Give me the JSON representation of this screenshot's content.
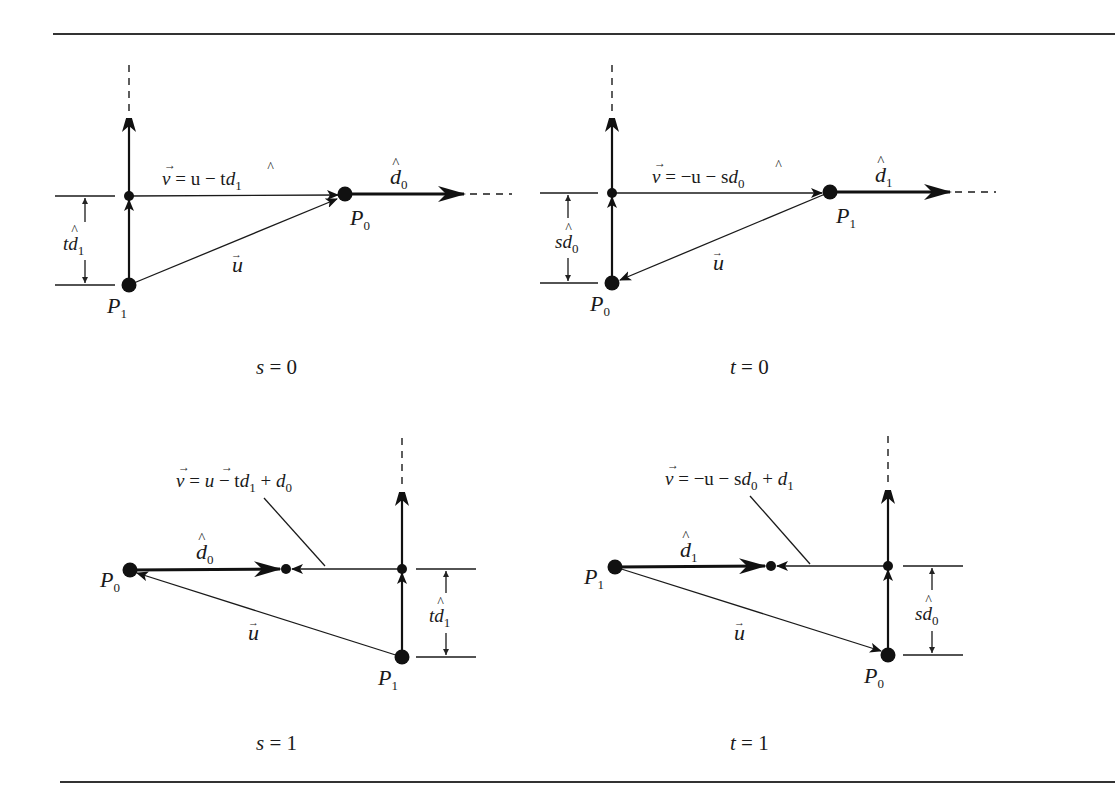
{
  "figure": {
    "rule_color": "#333333",
    "ink_color": "#111111",
    "panels": [
      {
        "id": "s0",
        "caption": {
          "var": "s",
          "eq": " = 0"
        },
        "equation": {
          "parts": [
            "v",
            " = u − t",
            "d",
            "1"
          ],
          "text": "v⃗ = u − td̂₁"
        },
        "dir_label": {
          "base": "d",
          "sub": "0"
        },
        "dim_label": {
          "pre": "t",
          "base": "d",
          "sub": "1"
        },
        "point_a": {
          "base": "P",
          "sub": "1"
        },
        "point_b": {
          "base": "P",
          "sub": "0"
        },
        "u_label": "u"
      },
      {
        "id": "t0",
        "caption": {
          "var": "t",
          "eq": " = 0"
        },
        "equation": {
          "text": "v⃗ = −u − sd̂₀"
        },
        "dir_label": {
          "base": "d",
          "sub": "1"
        },
        "dim_label": {
          "pre": "s",
          "base": "d",
          "sub": "0"
        },
        "point_a": {
          "base": "P",
          "sub": "0"
        },
        "point_b": {
          "base": "P",
          "sub": "1"
        },
        "u_label": "u"
      },
      {
        "id": "s1",
        "caption": {
          "var": "s",
          "eq": " = 1"
        },
        "equation": {
          "text": "v⃗ = u⃗ − td̂₁ + d̂₀"
        },
        "dir_label": {
          "base": "d",
          "sub": "0"
        },
        "dim_label": {
          "pre": "t",
          "base": "d",
          "sub": "1"
        },
        "point_a": {
          "base": "P",
          "sub": "1"
        },
        "point_b": {
          "base": "P",
          "sub": "0"
        },
        "u_label": "u"
      },
      {
        "id": "t1",
        "caption": {
          "var": "t",
          "eq": " = 1"
        },
        "equation": {
          "text": "v⃗ = −u − sd̂₀ + d̂₁"
        },
        "dir_label": {
          "base": "d",
          "sub": "1"
        },
        "dim_label": {
          "pre": "s",
          "base": "d",
          "sub": "0"
        },
        "point_a": {
          "base": "P",
          "sub": "0"
        },
        "point_b": {
          "base": "P",
          "sub": "1"
        },
        "u_label": "u"
      }
    ]
  },
  "text": {
    "eq_s0": {
      "v": "v",
      "rest": " = u − t",
      "d": "d",
      "sub": "1"
    },
    "eq_t0": {
      "v": "v",
      "rest": " = −u − s",
      "d": "d",
      "sub": "0"
    },
    "eq_s1": {
      "v": "v",
      "eq": " = ",
      "u": "u",
      "minus": " − t",
      "d1": "d",
      "sub1": "1",
      "plus": " + ",
      "d0": "d",
      "sub0": "0"
    },
    "eq_t1": {
      "v": "v",
      "rest": " = −u − s",
      "d0": "d",
      "sub0": "0",
      "plus": " + ",
      "d1": "d",
      "sub1": "1"
    },
    "P": "P",
    "d": "d",
    "s": "s",
    "t": "t",
    "u": "u",
    "sub0": "0",
    "sub1": "1",
    "eq0": " = 0",
    "eq1": " = 1"
  }
}
